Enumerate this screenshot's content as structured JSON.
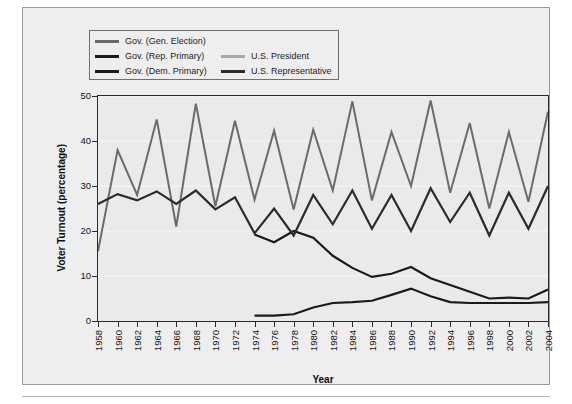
{
  "chart_data": {
    "type": "line",
    "title": "",
    "xlabel": "Year",
    "ylabel": "Voter Turnout (percentage)",
    "xlim": [
      1958,
      2004
    ],
    "ylim": [
      0,
      50
    ],
    "yticks": [
      0,
      10,
      20,
      30,
      40,
      50
    ],
    "grid": true,
    "grid_axis": "y",
    "legend_position": "top-left",
    "x": [
      1958,
      1960,
      1962,
      1964,
      1966,
      1968,
      1970,
      1972,
      1974,
      1976,
      1978,
      1980,
      1982,
      1984,
      1986,
      1988,
      1990,
      1992,
      1994,
      1996,
      1998,
      2000,
      2002,
      2004
    ],
    "categories": [
      "1958",
      "1960",
      "1962",
      "1964",
      "1966",
      "1968",
      "1970",
      "1972",
      "1974",
      "1976",
      "1978",
      "1980",
      "1982",
      "1984",
      "1986",
      "1988",
      "1990",
      "1992",
      "1994",
      "1996",
      "1998",
      "2000",
      "2002",
      "2004"
    ],
    "series": [
      {
        "name": "Gov. (Gen. Election)",
        "color": "#6b6b6b",
        "width": 2.0,
        "values": [
          15.5,
          38.0,
          28.0,
          44.8,
          21.0,
          48.3,
          25.5,
          44.5,
          27.0,
          42.3,
          24.8,
          42.5,
          29.0,
          48.8,
          26.8,
          42.0,
          30.0,
          49.0,
          28.5,
          44.0,
          25.0,
          42.0,
          26.5,
          46.5
        ]
      },
      {
        "name": "Gov. (Rep. Primary)",
        "color": "#1a1a1a",
        "width": 2.2,
        "values": [
          null,
          null,
          null,
          null,
          null,
          null,
          null,
          null,
          19.2,
          17.5,
          20.0,
          18.5,
          14.5,
          11.8,
          9.8,
          10.5,
          12.0,
          9.5,
          8.0,
          6.5,
          5.0,
          5.2,
          5.0,
          7.0
        ]
      },
      {
        "name": "Gov. (Dem. Primary)",
        "color": "#1a1a1a",
        "width": 2.2,
        "values": [
          null,
          null,
          null,
          null,
          null,
          null,
          null,
          null,
          1.2,
          1.2,
          1.5,
          3.0,
          4.0,
          4.2,
          4.5,
          5.8,
          7.2,
          5.5,
          4.2,
          4.0,
          4.0,
          4.0,
          4.0,
          4.2
        ]
      },
      {
        "name": "U.S. President",
        "color": "#a8a8a8",
        "width": 2.2,
        "values": [
          null,
          41.8,
          null,
          44.2,
          null,
          48.2,
          null,
          45.0,
          null,
          45.5,
          null,
          45.0,
          null,
          48.5,
          null,
          44.5,
          null,
          49.0,
          null,
          42.5,
          null,
          44.0,
          null,
          46.5
        ]
      },
      {
        "name": "U.S. Representative",
        "color": "#2b2b2b",
        "width": 2.2,
        "values": [
          26.0,
          28.2,
          26.8,
          28.8,
          26.0,
          29.0,
          24.8,
          27.5,
          19.5,
          25.0,
          19.0,
          28.0,
          21.5,
          29.0,
          20.5,
          28.0,
          20.0,
          29.5,
          22.0,
          28.5,
          19.0,
          28.5,
          20.5,
          30.0
        ]
      }
    ]
  },
  "legend": {
    "entries_left": [
      {
        "label": "Gov. (Gen. Election)",
        "color": "#6b6b6b"
      },
      {
        "label": "Gov. (Rep. Primary)",
        "color": "#1a1a1a"
      },
      {
        "label": "Gov. (Dem. Primary)",
        "color": "#1a1a1a"
      }
    ],
    "entries_right": [
      {
        "label": "U.S. President",
        "color": "#a8a8a8"
      },
      {
        "label": "U.S. Representative",
        "color": "#2b2b2b"
      }
    ]
  },
  "axes": {
    "y_title": "Voter Turnout (percentage)",
    "x_title": "Year",
    "y_ticks": [
      "50",
      "40",
      "30",
      "20",
      "10",
      "0"
    ],
    "x_ticks": [
      "1958",
      "1960",
      "1962",
      "1964",
      "1966",
      "1968",
      "1970",
      "1972",
      "1974",
      "1976",
      "1978",
      "1980",
      "1982",
      "1984",
      "1986",
      "1988",
      "1990",
      "1992",
      "1994",
      "1996",
      "1998",
      "2000",
      "2002",
      "2004"
    ]
  },
  "colors": {
    "background": "#ffffff",
    "panel": "#eeeeee",
    "plot_background": "#eaeaea",
    "axis": "#2a2a2a",
    "gridline": "#f6f6f6"
  }
}
